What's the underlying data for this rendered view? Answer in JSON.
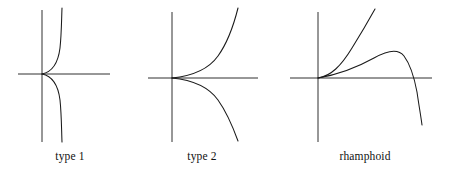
{
  "figure": {
    "background_color": "#ffffff",
    "stroke_color": "#1a1a1a",
    "width": 454,
    "height": 180,
    "panel_count": 3
  },
  "panels": [
    {
      "id": "type-1",
      "caption": "type 1",
      "description": "Vertical-tangent cusp: two branches meeting at the origin with a common vertical tangent, bulging to the right before sweeping up and down.",
      "origin": {
        "x": 42,
        "y": 74
      },
      "axes": {
        "x_axis": {
          "x1": 18,
          "y1": 74,
          "x2": 110,
          "y2": 74
        },
        "y_axis": {
          "x1": 42,
          "y1": 10,
          "x2": 42,
          "y2": 142
        }
      },
      "curves": [
        {
          "name": "upper-branch",
          "path": "M 42 74 C 52 72 58 64 60 48 C 61.5 34 61.5 20 62 8"
        },
        {
          "name": "lower-branch",
          "path": "M 42 74 C 52 76 58 84 60 100 C 61.5 114 61.5 130 62 142"
        }
      ]
    },
    {
      "id": "type-2",
      "caption": "type 2",
      "description": "Ordinary cusp: two branches tangent to the positive x-axis at the origin, opening up and down to the right.",
      "origin": {
        "x": 172,
        "y": 78
      },
      "axes": {
        "x_axis": {
          "x1": 148,
          "y1": 78,
          "x2": 258,
          "y2": 78
        },
        "y_axis": {
          "x1": 172,
          "y1": 12,
          "x2": 172,
          "y2": 142
        }
      },
      "curves": [
        {
          "name": "upper-branch",
          "path": "M 172 78 C 192 76 208 70 218 56 C 228 42 234 24 238 8"
        },
        {
          "name": "lower-branch",
          "path": "M 172 78 C 192 80 208 86 218 100 C 228 114 234 130 238 141"
        }
      ]
    },
    {
      "id": "rhamphoid",
      "caption": "rhamphoid",
      "description": "Rhamphoid (beak) cusp: both branches leave the origin on the same side, tangent to the positive x-axis; one rises steeply while the other arcs over, turns, and descends across the x-axis.",
      "origin": {
        "x": 318,
        "y": 78
      },
      "axes": {
        "x_axis": {
          "x1": 290,
          "y1": 78,
          "x2": 432,
          "y2": 78
        },
        "y_axis": {
          "x1": 318,
          "y1": 12,
          "x2": 318,
          "y2": 142
        }
      },
      "curves": [
        {
          "name": "steep-branch",
          "path": "M 318 78 C 331 76 341 66 352 48 C 362 32 370 18 375 9"
        },
        {
          "name": "arching-branch",
          "path": "M 318 78 C 336 75 356 68 374 58 C 388 50 398 48 404 56 C 410 64 414 76 417 92 C 419 106 421 117 422 125"
        }
      ]
    }
  ]
}
